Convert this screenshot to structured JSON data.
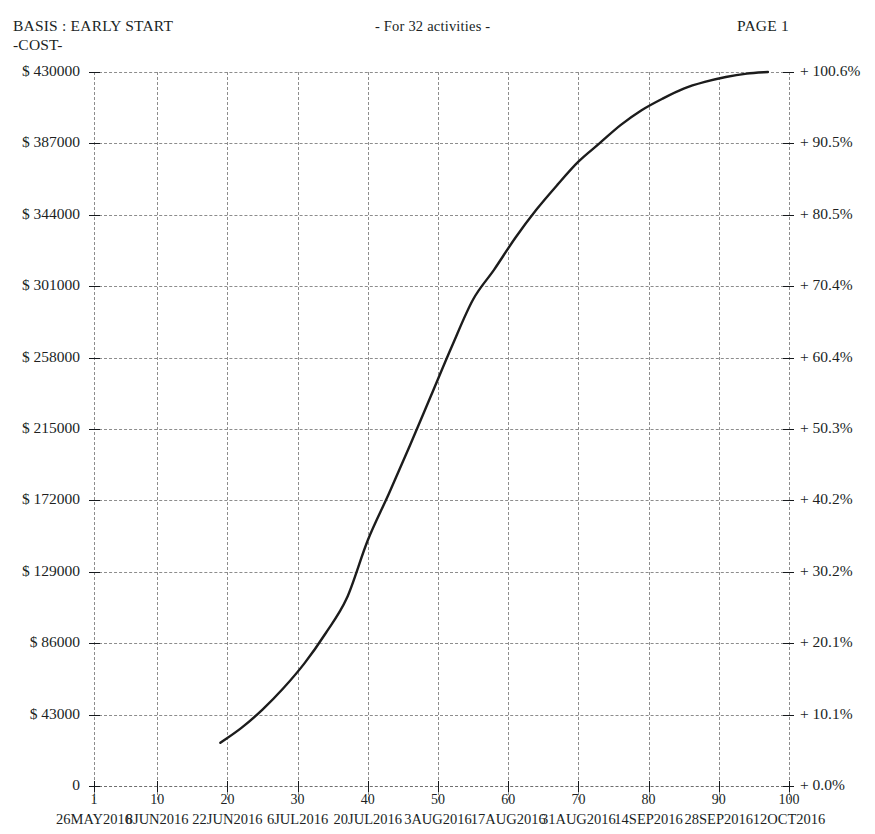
{
  "header": {
    "basis": "BASIS : EARLY START",
    "cost": "-COST-",
    "activities": "- For  32 activities -",
    "page": "PAGE 1"
  },
  "chart_data": {
    "type": "line",
    "title": "BASIS : EARLY START -COST-",
    "subtitle": "- For  32 activities -",
    "xlabel": "",
    "ylabel": "",
    "grid": true,
    "legend_position": "none",
    "xlim": [
      1,
      100
    ],
    "ylim": [
      0,
      430000
    ],
    "y2lim": [
      0.0,
      100.6
    ],
    "x_ticks": [
      1,
      10,
      20,
      30,
      40,
      50,
      60,
      70,
      80,
      90,
      100
    ],
    "x_tick_labels": [
      "1",
      "10",
      "20",
      "30",
      "40",
      "50",
      "60",
      "70",
      "80",
      "90",
      "100"
    ],
    "x_date_labels": [
      "26MAY2016",
      "8JUN2016",
      "22JUN2016",
      "6JUL2016",
      "20JUL2016",
      "3AUG2016",
      "17AUG2016",
      "31AUG2016",
      "14SEP2016",
      "28SEP2016",
      "12OCT2016"
    ],
    "y_ticks": [
      0,
      43000,
      86000,
      129000,
      172000,
      215000,
      258000,
      301000,
      344000,
      387000,
      430000
    ],
    "y_tick_labels": [
      "0",
      "$ 43000",
      "$ 86000",
      "$ 129000",
      "$ 172000",
      "$ 215000",
      "$ 258000",
      "$ 301000",
      "$ 344000",
      "$ 387000",
      "$ 430000"
    ],
    "y2_ticks": [
      0.0,
      10.1,
      20.1,
      30.2,
      40.2,
      50.3,
      60.4,
      70.4,
      80.5,
      90.5,
      100.6
    ],
    "y2_tick_labels": [
      "+ 0.0%",
      "+ 10.1%",
      "+ 20.1%",
      "+ 30.2%",
      "+ 40.2%",
      "+ 50.3%",
      "+ 60.4%",
      "+ 70.4%",
      "+ 80.5%",
      "+ 90.5%",
      "+ 100.6%"
    ],
    "series": [
      {
        "name": "Cumulative early start cost",
        "x": [
          19,
          22,
          25,
          28,
          31,
          34,
          37,
          40,
          43,
          46,
          49,
          52,
          55,
          58,
          61,
          64,
          67,
          70,
          73,
          76,
          79,
          82,
          85,
          88,
          91,
          94,
          97
        ],
        "values": [
          26000,
          35000,
          46000,
          59000,
          74000,
          92000,
          113000,
          148000,
          176000,
          205000,
          235000,
          265000,
          293000,
          311000,
          330000,
          347000,
          362000,
          376000,
          387000,
          398000,
          407000,
          414000,
          420000,
          424000,
          427000,
          429000,
          430000
        ]
      }
    ]
  }
}
